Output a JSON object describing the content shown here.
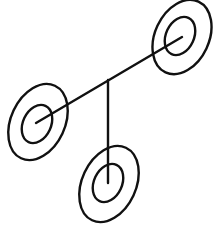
{
  "diagram": {
    "background": "#ffffff",
    "stroke_color": "#111111",
    "stroke_width": 2.4,
    "nodes": [
      {
        "id": "upper-right",
        "outer": {
          "cx": 182,
          "cy": 37,
          "rx": 27,
          "ry": 39,
          "rotate": 25
        },
        "inner": {
          "cx": 180,
          "cy": 36,
          "rx": 14,
          "ry": 20,
          "rotate": 25
        }
      },
      {
        "id": "left",
        "outer": {
          "cx": 38,
          "cy": 122,
          "rx": 27,
          "ry": 40,
          "rotate": 25
        },
        "inner": {
          "cx": 37,
          "cy": 124,
          "rx": 14,
          "ry": 20,
          "rotate": 25
        }
      },
      {
        "id": "bottom",
        "outer": {
          "cx": 109,
          "cy": 184,
          "rx": 27,
          "ry": 40,
          "rotate": 25
        },
        "inner": {
          "cx": 108,
          "cy": 183,
          "rx": 14,
          "ry": 20,
          "rotate": 25
        }
      }
    ],
    "edges": [
      {
        "id": "diagonal-axis",
        "x1": 36,
        "y1": 123,
        "x2": 182,
        "y2": 37
      },
      {
        "id": "vertical-stem",
        "x1": 108,
        "y1": 80,
        "x2": 108,
        "y2": 183
      }
    ]
  }
}
